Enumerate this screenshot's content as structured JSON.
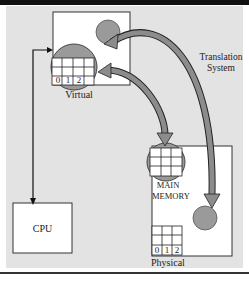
{
  "diagram": {
    "labels": {
      "virtual": "Virtual",
      "translation": "Translation System",
      "translation_line1": "Translation",
      "translation_line2": "System",
      "main_memory_line1": "MAIN",
      "main_memory_line2": "MEMORY",
      "physical": "Physical",
      "cpu": "CPU"
    },
    "virtual_page_numbers": [
      "0",
      "1",
      "2"
    ],
    "physical_page_numbers": [
      "0",
      "1",
      "2"
    ],
    "colors": {
      "background_panel": "#e3e3e3",
      "box_fill": "#ffffff",
      "circle_fill": "#9a9a9a",
      "arrow_fill": "#8c8c8c",
      "line": "#222222"
    }
  }
}
